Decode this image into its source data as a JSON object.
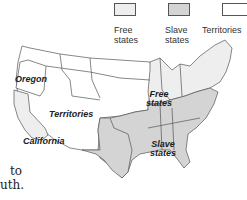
{
  "legend": {
    "items": [
      {
        "label_line1": "Free",
        "label_line2": "states",
        "fill": "#eeeeee"
      },
      {
        "label_line1": "Slave",
        "label_line2": "states",
        "fill": "#d4d4d4"
      },
      {
        "label_line1": "Territories",
        "label_line2": "",
        "fill": "#ffffff"
      }
    ]
  },
  "map": {
    "labels": {
      "oregon": "Oregon",
      "territories": "Territories",
      "california": "California",
      "free_line1": "Free",
      "free_line2": "states",
      "slave_line1": "Slave",
      "slave_line2": "states"
    },
    "colors": {
      "free": "#eeeeee",
      "slave": "#d4d4d4",
      "territory": "#ffffff",
      "border": "#555555"
    }
  },
  "body_text": {
    "line1": "to",
    "line2": "uth."
  }
}
